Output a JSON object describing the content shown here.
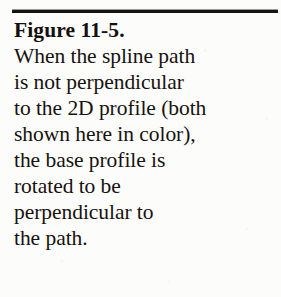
{
  "document": {
    "type": "figure-caption",
    "background_color": "#fcfcfb",
    "text_color": "#17130f",
    "rule_color": "#16120f",
    "heading": "Figure 11-5.",
    "body_lines": [
      "When the spline path",
      "is not perpendicular",
      "to the 2D profile (both",
      "shown here in color),",
      "the base profile is",
      "rotated to be",
      "perpendicular to",
      "the path."
    ],
    "full_text": "Figure 11-5. When the spline path is not perpendicular to the 2D profile (both shown here in color), the base profile is rotated to be perpendicular to the path.",
    "figure_number": "11-5"
  }
}
